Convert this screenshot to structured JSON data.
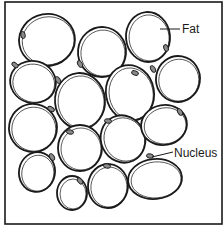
{
  "figure": {
    "type": "illustration",
    "frame": {
      "x": 5,
      "y": 2,
      "width": 217,
      "height": 222,
      "stroke": "#1a1a1a"
    },
    "colors": {
      "line": "#1a1a1a",
      "background": "#ffffff",
      "cell_fill": "#ffffff",
      "nucleus_fill": "#8a8a8a"
    }
  },
  "labels": {
    "fat": "Fat",
    "nucleus": "Nucleus"
  },
  "cells": [
    {
      "id": 1,
      "cx": 47,
      "cy": 40,
      "rx": 28,
      "ry": 26,
      "rot": -10,
      "nx": 23,
      "ny": 35,
      "nrot": 80
    },
    {
      "id": 2,
      "cx": 102,
      "cy": 52,
      "rx": 24,
      "ry": 25,
      "rot": 5,
      "nx": 80,
      "ny": 64,
      "nrot": 60
    },
    {
      "id": 3,
      "cx": 148,
      "cy": 37,
      "rx": 22,
      "ry": 25,
      "rot": -5,
      "nx": 166,
      "ny": 48,
      "nrot": 70
    },
    {
      "id": 4,
      "cx": 33,
      "cy": 82,
      "rx": 23,
      "ry": 21,
      "rot": 15,
      "nx": 15,
      "ny": 65,
      "nrot": 40
    },
    {
      "id": 5,
      "cx": 80,
      "cy": 101,
      "rx": 25,
      "ry": 28,
      "rot": -5,
      "nx": 58,
      "ny": 80,
      "nrot": 60
    },
    {
      "id": 6,
      "cx": 130,
      "cy": 93,
      "rx": 24,
      "ry": 28,
      "rot": -10,
      "nx": 135,
      "ny": 73,
      "nrot": 20
    },
    {
      "id": 7,
      "cx": 178,
      "cy": 79,
      "rx": 22,
      "ry": 23,
      "rot": 10,
      "nx": 153,
      "ny": 69,
      "nrot": 60
    },
    {
      "id": 8,
      "cx": 33,
      "cy": 128,
      "rx": 24,
      "ry": 24,
      "rot": 10,
      "nx": 51,
      "ny": 109,
      "nrot": 30
    },
    {
      "id": 9,
      "cx": 80,
      "cy": 148,
      "rx": 22,
      "ry": 23,
      "rot": 0,
      "nx": 70,
      "ny": 132,
      "nrot": 10
    },
    {
      "id": 10,
      "cx": 123,
      "cy": 139,
      "rx": 22,
      "ry": 24,
      "rot": -25,
      "nx": 108,
      "ny": 121,
      "nrot": 10
    },
    {
      "id": 11,
      "cx": 164,
      "cy": 125,
      "rx": 23,
      "ry": 20,
      "rot": -10,
      "nx": 180,
      "ny": 112,
      "nrot": 60
    },
    {
      "id": 12,
      "cx": 37,
      "cy": 172,
      "rx": 18,
      "ry": 20,
      "rot": 10,
      "nx": 52,
      "ny": 157,
      "nrot": 60
    },
    {
      "id": 13,
      "cx": 155,
      "cy": 179,
      "rx": 27,
      "ry": 20,
      "rot": -5,
      "nx": 150,
      "ny": 156,
      "nrot": 10
    },
    {
      "id": 14,
      "cx": 72,
      "cy": 193,
      "rx": 15,
      "ry": 17,
      "rot": 0,
      "nx": 80,
      "ny": 181,
      "nrot": 50
    },
    {
      "id": 15,
      "cx": 108,
      "cy": 186,
      "rx": 20,
      "ry": 22,
      "rot": 5,
      "nx": 107,
      "ny": 166,
      "nrot": 10
    }
  ],
  "annotations": [
    {
      "label_key": "fat",
      "line": {
        "x1": 160,
        "y1": 29,
        "x2": 180,
        "y2": 29
      },
      "text_x": 182,
      "text_y": 33
    },
    {
      "label_key": "nucleus",
      "line": {
        "x1": 152,
        "y1": 157,
        "x2": 173,
        "y2": 152
      },
      "text_x": 174,
      "text_y": 157
    }
  ]
}
